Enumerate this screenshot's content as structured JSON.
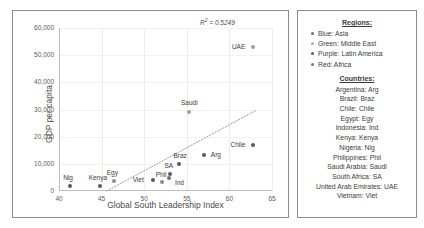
{
  "chart_data": {
    "type": "scatter",
    "title": "",
    "xlabel": "Global South Leadership Index",
    "ylabel": "GDP per capita",
    "xlim": [
      40,
      65
    ],
    "ylim": [
      0,
      60000
    ],
    "xticks": [
      "40",
      "45",
      "50",
      "55",
      "60",
      "65"
    ],
    "xtick_values": [
      40,
      45,
      50,
      55,
      60,
      65
    ],
    "yticks": [
      "0",
      "10,000",
      "20,000",
      "30,000",
      "40,000",
      "50,000",
      "60,000"
    ],
    "ytick_values": [
      0,
      10000,
      20000,
      30000,
      40000,
      50000,
      60000
    ],
    "grid": true,
    "legend_position": "right-panel",
    "annotation": "R² = 0.5249",
    "annotation_r2_value": 0.5249,
    "trendline": {
      "style": "dotted",
      "x_start": 45.6,
      "y_start": 0,
      "x_end": 63.2,
      "y_end": 29800
    },
    "points": [
      {
        "label": "Nig",
        "x": 41.3,
        "y": 1700,
        "region": "Africa",
        "color": "#595959",
        "label_dx": -2,
        "label_dy": -8,
        "label_align": "center"
      },
      {
        "label": "Kenya",
        "x": 44.8,
        "y": 1900,
        "region": "Africa",
        "color": "#595959",
        "label_dx": -2,
        "label_dy": -8,
        "label_align": "center"
      },
      {
        "label": "Egy",
        "x": 46.5,
        "y": 3600,
        "region": "Africa",
        "color": "#8c8c8c",
        "label_dx": -2,
        "label_dy": -8,
        "label_align": "center"
      },
      {
        "label": "Viet",
        "x": 51.0,
        "y": 4100,
        "region": "Asia",
        "color": "#595959",
        "label_dx": -9,
        "label_dy": 0,
        "label_align": "right"
      },
      {
        "label": "Phil",
        "x": 52.1,
        "y": 3300,
        "region": "Asia",
        "color": "#8c8c8c",
        "label_dx": -1,
        "label_dy": -7,
        "label_align": "center"
      },
      {
        "label": "Ind",
        "x": 52.9,
        "y": 4700,
        "region": "Asia",
        "color": "#6e6e6e",
        "label_dx": 6,
        "label_dy": 5,
        "label_align": "left"
      },
      {
        "label": "SA",
        "x": 53.0,
        "y": 6100,
        "region": "Africa",
        "color": "#595959",
        "label_dx": -1,
        "label_dy": -8,
        "label_align": "center"
      },
      {
        "label": "Braz",
        "x": 54.1,
        "y": 10000,
        "region": "Latin America",
        "color": "#595959",
        "label_dx": 1,
        "label_dy": -8,
        "label_align": "center"
      },
      {
        "label": "Arg",
        "x": 57.0,
        "y": 13400,
        "region": "Latin America",
        "color": "#595959",
        "label_dx": 7,
        "label_dy": 0,
        "label_align": "left"
      },
      {
        "label": "Chile",
        "x": 62.8,
        "y": 16800,
        "region": "Latin America",
        "color": "#595959",
        "label_dx": -8,
        "label_dy": 0,
        "label_align": "right"
      },
      {
        "label": "Saudi",
        "x": 55.3,
        "y": 29200,
        "region": "Middle East",
        "color": "#9e9e9e",
        "label_dx": 0,
        "label_dy": -9,
        "label_align": "center"
      },
      {
        "label": "UAE",
        "x": 62.8,
        "y": 53000,
        "region": "Middle East",
        "color": "#9e9e9e",
        "label_dx": -8,
        "label_dy": 0,
        "label_align": "right"
      }
    ]
  },
  "legend": {
    "regions_heading": "Regions:",
    "regions": [
      {
        "label": "Blue: Asia",
        "color": "#6b6b6b"
      },
      {
        "label": "Green: Middle East",
        "color": "#b0b0b0"
      },
      {
        "label": "Purple: Latin America",
        "color": "#5a5a5a"
      },
      {
        "label": "Red: Africa",
        "color": "#737373"
      }
    ],
    "countries_heading": "Countries:",
    "countries": [
      "Argentina: Arg",
      "Brazil: Braz",
      "Chile: Chile",
      "Egypt: Egy",
      "Indonesia: Ind",
      "Kenya: Kenya",
      "Nigeria: Nig",
      "Philippines: Phil",
      "Saudi Arabia: Saudi",
      "South Africa: SA",
      "United Arab Emirates: UAE",
      "Vietnam: Viet"
    ]
  }
}
